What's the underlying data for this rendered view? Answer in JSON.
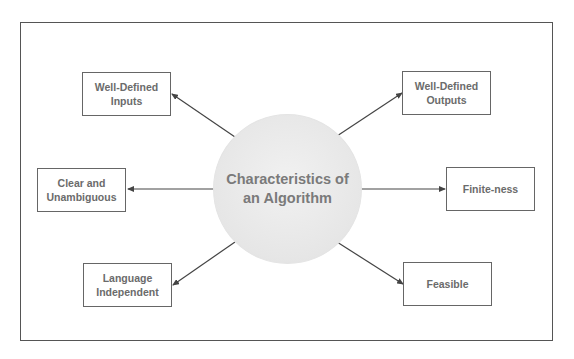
{
  "diagram": {
    "title": "Characteristics of\nan Algorithm",
    "nodes": [
      {
        "id": "well-defined-inputs",
        "label": "Well-Defined\nInputs",
        "position": "top-left"
      },
      {
        "id": "clear-and-unambiguous",
        "label": "Clear and\nUnambiguous",
        "position": "middle-left"
      },
      {
        "id": "language-independent",
        "label": "Language\nIndependent",
        "position": "bottom-left"
      },
      {
        "id": "well-defined-outputs",
        "label": "Well-Defined\nOutputs",
        "position": "top-right"
      },
      {
        "id": "finite-ness",
        "label": "Finite-ness",
        "position": "middle-right"
      },
      {
        "id": "feasible",
        "label": "Feasible",
        "position": "bottom-right"
      }
    ],
    "edges": [
      {
        "from": "center",
        "to": "well-defined-inputs"
      },
      {
        "from": "center",
        "to": "clear-and-unambiguous"
      },
      {
        "from": "center",
        "to": "language-independent"
      },
      {
        "from": "center",
        "to": "well-defined-outputs"
      },
      {
        "from": "center",
        "to": "finite-ness"
      },
      {
        "from": "center",
        "to": "feasible"
      }
    ],
    "colors": {
      "frame": "#555555",
      "node_border": "#666666",
      "node_text": "#6b6b6b",
      "circle_fill": "#e8e8e8",
      "arrow": "#444444"
    }
  }
}
